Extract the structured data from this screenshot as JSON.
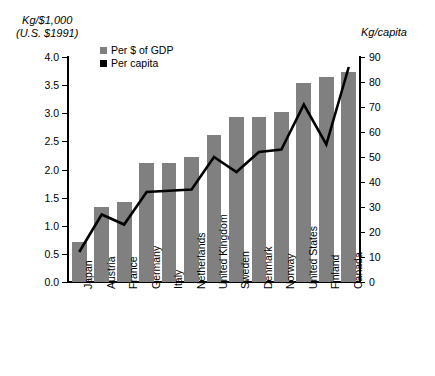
{
  "chart_data": {
    "type": "bar",
    "title": "",
    "categories": [
      "Japan",
      "Austria",
      "France",
      "Germany",
      "Italy",
      "Netherlands",
      "United Kingdom",
      "Sweden",
      "Denmark",
      "Norway",
      "United States",
      "Finland",
      "Canada"
    ],
    "series": [
      {
        "name": "Per $ of GDP",
        "type": "bar",
        "axis": "left",
        "color": "#808080",
        "values": [
          0.72,
          1.33,
          1.42,
          2.12,
          2.12,
          2.23,
          2.62,
          2.93,
          2.93,
          3.02,
          3.54,
          3.65,
          3.74
        ]
      },
      {
        "name": "Per capita",
        "type": "line",
        "axis": "right",
        "color": "#000000",
        "values": [
          12,
          27,
          23,
          36,
          36.5,
          37,
          50,
          44,
          52,
          53,
          71,
          55,
          86
        ]
      }
    ],
    "xlabel": "",
    "ylabel": "Kg/$1,000 (U.S. $1991)",
    "ylabel_line1": "Kg/$1,000",
    "ylabel_line2": "(U.S. $1991)",
    "y2label": "Kg/capita",
    "ylim": [
      0,
      4.0
    ],
    "y2lim": [
      0,
      90
    ],
    "yticks": [
      "0.0",
      "0.5",
      "1.0",
      "1.5",
      "2.0",
      "2.5",
      "3.0",
      "3.5",
      "4.0"
    ],
    "ytick_values": [
      0,
      0.5,
      1.0,
      1.5,
      2.0,
      2.5,
      3.0,
      3.5,
      4.0
    ],
    "y2ticks": [
      "0",
      "10",
      "20",
      "30",
      "40",
      "50",
      "60",
      "70",
      "80",
      "90"
    ],
    "y2tick_values": [
      0,
      10,
      20,
      30,
      40,
      50,
      60,
      70,
      80,
      90
    ],
    "grid": false,
    "legend_position": "top-left-inside"
  },
  "legend": {
    "items": [
      {
        "label": "Per $ of GDP",
        "color": "#808080"
      },
      {
        "label": "Per capita",
        "color": "#000000"
      }
    ]
  }
}
